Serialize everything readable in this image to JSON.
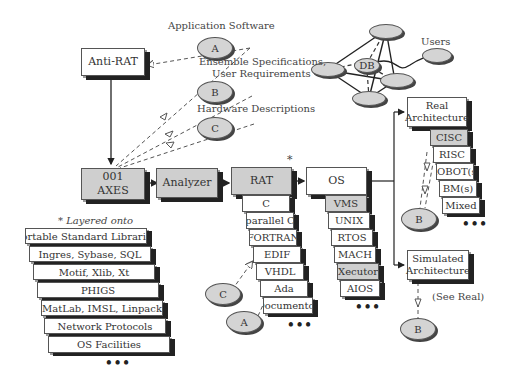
{
  "top_labels": {
    "application_software": "Application Software",
    "ensemble_line1": "Ensemble Specifications,",
    "ensemble_line2": "User Requirements",
    "hardware_descriptions": "Hardware Descriptions",
    "users": "Users",
    "db": "DB"
  },
  "ovals": {
    "a": "A",
    "b": "B",
    "c": "C"
  },
  "boxes": {
    "anti_rat": "Anti-RAT",
    "axes_line1": "001",
    "axes_line2": "AXES",
    "analyzer": "Analyzer",
    "rat": "RAT",
    "rat_star": "*",
    "os": "OS",
    "real_line1": "Real",
    "real_line2": "Architecture",
    "sim_line1": "Simulated",
    "sim_line2": "Architecture",
    "see_real": "(See Real)"
  },
  "rat_stack": [
    "C",
    "parallel C",
    "FORTRAN",
    "EDIF",
    "VHDL",
    "Ada",
    "Documentor"
  ],
  "os_stack": [
    "VMS",
    "UNIX",
    "RTOS",
    "MACH",
    "Xecutor",
    "AIOS"
  ],
  "arch_stack": [
    "CISC",
    "RISC",
    "ROBOT(s)",
    "BM(s)",
    "Mixed"
  ],
  "layered": {
    "title": "* Layered onto",
    "items": [
      "Portable Standard Libraries",
      "Ingres, Sybase, SQL",
      "Motif, Xlib, Xt",
      "PHIGS",
      "MatLab, IMSL, Linpack",
      "Network Protocols",
      "OS Facilities"
    ]
  },
  "ellipsis": "•••"
}
